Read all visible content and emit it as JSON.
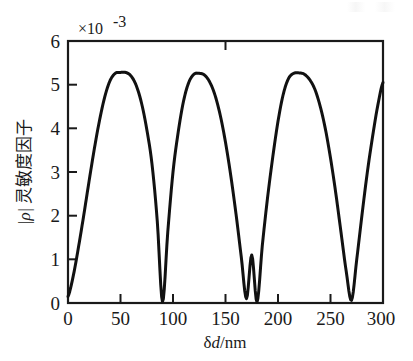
{
  "figure": {
    "background_color": "#ffffff",
    "line_color": "#111111",
    "axis_color": "#1a1a1a"
  },
  "chart_data": {
    "type": "line",
    "title": "",
    "subtitle": "",
    "xlabel_prefix": "δ",
    "xlabel_italic": "d",
    "xlabel_suffix": "/nm",
    "xlabel": "δd/nm",
    "ylabel": "|ρ| 灵敏度因子",
    "ylabel_symbol": "|ρ|",
    "ylabel_text": "灵敏度因子",
    "y_multiplier": "×10",
    "y_multiplier_exponent": "-3",
    "y_multiplier_full": "×10⁻³",
    "xlim": [
      0,
      300
    ],
    "ylim": [
      0,
      6
    ],
    "xticks": [
      0,
      50,
      100,
      150,
      200,
      250,
      300
    ],
    "xtick_labels": [
      "0",
      "50",
      "100",
      "150",
      "200",
      "250",
      "300"
    ],
    "yticks": [
      0,
      1,
      2,
      3,
      4,
      5,
      6
    ],
    "ytick_labels": [
      "0",
      "1",
      "2",
      "3",
      "4",
      "5",
      "6"
    ],
    "grid": false,
    "legend": false,
    "tick_direction": "in",
    "series": [
      {
        "name": "|ρ| sensitivity factor",
        "period_nm": 90,
        "peak_value": 5.28,
        "min_value": 0.02,
        "peaks_x": [
          55,
          125,
          237
        ],
        "peaks_y": [
          5.28,
          5.26,
          5.27
        ],
        "minima_x": [
          90,
          180,
          270
        ],
        "minima_y": [
          0.03,
          0.02,
          0.06
        ],
        "start_point": [
          0,
          0.15
        ],
        "end_point": [
          300,
          5.05
        ],
        "x": [
          0,
          5,
          10,
          15,
          20,
          25,
          30,
          35,
          40,
          45,
          50,
          55,
          60,
          65,
          70,
          75,
          80,
          85,
          90,
          95,
          100,
          105,
          110,
          115,
          120,
          125,
          130,
          135,
          140,
          145,
          150,
          155,
          160,
          165,
          170,
          175,
          180,
          185,
          190,
          195,
          200,
          205,
          210,
          215,
          220,
          225,
          230,
          235,
          240,
          245,
          250,
          255,
          260,
          265,
          270,
          275,
          280,
          285,
          290,
          295,
          300
        ],
        "values": [
          0.15,
          0.62,
          1.28,
          2.01,
          2.78,
          3.52,
          4.18,
          4.72,
          5.09,
          5.26,
          5.28,
          5.28,
          5.2,
          4.98,
          4.58,
          3.98,
          3.18,
          1.88,
          0.03,
          1.62,
          3.0,
          3.92,
          4.62,
          5.05,
          5.24,
          5.26,
          5.22,
          5.06,
          4.76,
          4.3,
          3.68,
          2.92,
          2.04,
          1.06,
          0.1,
          1.1,
          0.02,
          1.3,
          2.4,
          3.34,
          4.16,
          4.78,
          5.14,
          5.26,
          5.27,
          5.24,
          5.12,
          4.9,
          4.52,
          4.0,
          3.32,
          2.52,
          1.62,
          0.72,
          0.06,
          1.0,
          2.02,
          2.98,
          3.8,
          4.52,
          5.05
        ]
      }
    ]
  },
  "axes_geometry": {
    "plot_left_px": 68,
    "plot_right_px": 383,
    "plot_top_px": 41,
    "plot_bottom_px": 303
  }
}
